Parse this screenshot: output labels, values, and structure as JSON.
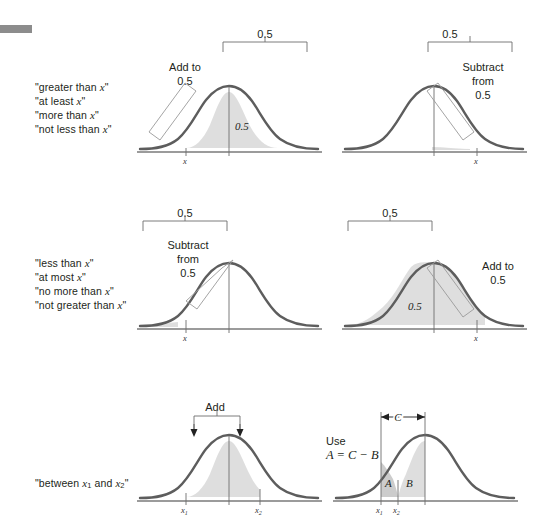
{
  "figure": {
    "decor_bar": "gray-rule",
    "background": "#ffffff",
    "curve_color": "#5d5d5d",
    "shade_color": "#dcdcdc"
  },
  "panels": [
    {
      "id": "greater-than",
      "labels": [
        "\"greater than x\"",
        "\"at least x\"",
        "\"more than x\"",
        "\"not less than x\""
      ],
      "note": "Add to\n0.5",
      "note_line1": "Add to",
      "note_line2": "0.5",
      "bracket_value": "0.5",
      "area_value": "0.5",
      "x_tick": "x"
    },
    {
      "id": "greater-than-right",
      "note_line1": "Subtract",
      "note_line2": "from",
      "note_line3": "0.5",
      "bracket_value": "0.5",
      "x_tick": "x"
    },
    {
      "id": "less-than",
      "labels": [
        "\"less than x\"",
        "\"at most x\"",
        "\"no more than x\"",
        "\"not greater than x\""
      ],
      "note_line1": "Subtract",
      "note_line2": "from",
      "note_line3": "0.5",
      "bracket_value": "0.5",
      "x_tick": "x"
    },
    {
      "id": "less-than-right",
      "note_line1": "Add to",
      "note_line2": "0.5",
      "bracket_value": "0.5",
      "area_value": "0.5",
      "x_tick": "x"
    },
    {
      "id": "between",
      "labels": [
        "\"between x1 and x2\""
      ],
      "label_prefix": "\"between ",
      "label_var1": "x",
      "label_sub1": "1",
      "label_mid": " and ",
      "label_var2": "x",
      "label_sub2": "2",
      "label_suffix": "\"",
      "note": "Add",
      "x_tick_1": "x",
      "x_tick_1_sub": "1",
      "x_tick_2": "x",
      "x_tick_2_sub": "2"
    },
    {
      "id": "between-right",
      "note_line1": "Use",
      "note_line2": "A = C − B",
      "bracket_label": "C",
      "area_a": "A",
      "area_b": "B",
      "x_tick_1": "x",
      "x_tick_1_sub": "1",
      "x_tick_2": "x",
      "x_tick_2_sub": "2"
    }
  ]
}
